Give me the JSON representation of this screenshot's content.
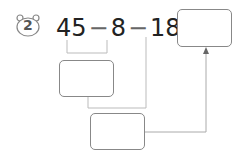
{
  "problem": {
    "number": "2",
    "terms": [
      "45",
      "8",
      "18"
    ],
    "operators": [
      "−",
      "−",
      "="
    ],
    "boxes": {
      "intermediate_1": "",
      "intermediate_2": "",
      "result": ""
    }
  },
  "colors": {
    "text": "#222222",
    "line": "#bbbbbb",
    "box_border": "#888888"
  }
}
